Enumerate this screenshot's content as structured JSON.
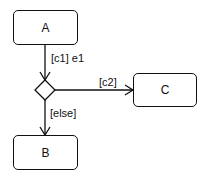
{
  "diagram": {
    "type": "uml-state-machine",
    "states": [
      {
        "id": "A",
        "label": "A"
      },
      {
        "id": "B",
        "label": "B"
      },
      {
        "id": "C",
        "label": "C"
      }
    ],
    "choice": {
      "id": "choice1",
      "shape": "diamond"
    },
    "transitions": [
      {
        "from": "A",
        "to": "choice1",
        "label": "[c1] e1"
      },
      {
        "from": "choice1",
        "to": "C",
        "label": "[c2]"
      },
      {
        "from": "choice1",
        "to": "B",
        "label": "[else]"
      }
    ]
  }
}
